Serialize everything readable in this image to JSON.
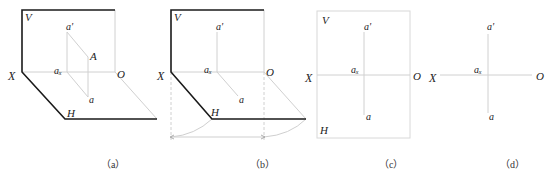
{
  "panels": [
    {
      "id": "a",
      "caption": "（a）",
      "labels": {
        "V": "V",
        "X": "X",
        "O": "O",
        "H": "H",
        "A": "A",
        "a_prime": "a'",
        "a_x": "aₓ",
        "a": "a"
      }
    },
    {
      "id": "b",
      "caption": "（b）",
      "labels": {
        "V": "V",
        "X": "X",
        "O": "O",
        "H": "H",
        "a_prime": "a'",
        "a_x": "aₓ",
        "a": "a"
      }
    },
    {
      "id": "c",
      "caption": "（c）",
      "labels": {
        "V": "V",
        "X": "X",
        "O": "O",
        "H": "H",
        "a_prime": "a'",
        "a_x": "aₓ",
        "a": "a"
      }
    },
    {
      "id": "d",
      "caption": "（d）",
      "labels": {
        "X": "X",
        "O": "O",
        "a_prime": "a'",
        "a_x": "aₓ",
        "a": "a"
      }
    }
  ],
  "colors": {
    "heavy": "#1a1a1a",
    "light": "#cfcfcf",
    "text": "#222222"
  }
}
